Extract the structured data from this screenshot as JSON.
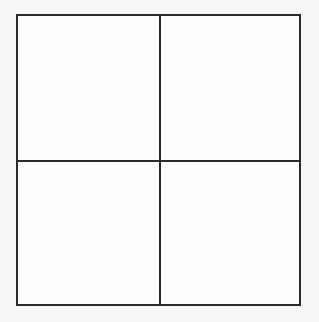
{
  "diagram": {
    "type": "2x2 grid",
    "rows": 2,
    "columns": 2,
    "line_color": "#2a2a2a",
    "background_color": "#f7f7f5",
    "cells": [
      {
        "row": 0,
        "col": 0,
        "label": ""
      },
      {
        "row": 0,
        "col": 1,
        "label": ""
      },
      {
        "row": 1,
        "col": 0,
        "label": ""
      },
      {
        "row": 1,
        "col": 1,
        "label": ""
      }
    ]
  }
}
